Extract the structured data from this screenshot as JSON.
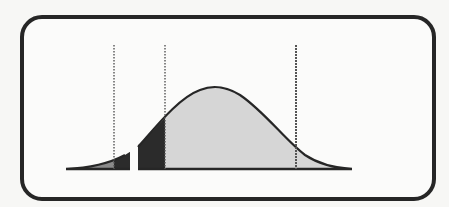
{
  "diagram": {
    "segments": [
      {
        "id": "innovators",
        "line1": "INNOVATORS",
        "line2": ""
      },
      {
        "id": "early-adopters",
        "line1": "EARLY",
        "line2": "ADOPTERS"
      },
      {
        "id": "early-majority",
        "line1": "EARLY",
        "line2": "MAJORITY"
      },
      {
        "id": "late-majority",
        "line1": "LATE",
        "line2": "MAJORITY"
      },
      {
        "id": "laggards",
        "line1": "LAGGARDS",
        "line2": ""
      }
    ],
    "chasm_label": "THE CHASM",
    "callout": {
      "line1": "AREA UNDER THE CURVE",
      "line2": "REPRESENTS THE NUMBER",
      "line3": "OF CUSTOMERS"
    },
    "colors": {
      "frame": "#262626",
      "curve": "#262626",
      "innovators_fill": "#8a8a8a",
      "early_adopters_fill": "#2b2b2b",
      "majority_fill": "#d6d6d6",
      "chasm_box": "#2b2b2b"
    }
  }
}
